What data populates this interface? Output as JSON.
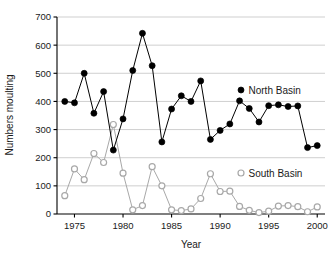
{
  "chart_data": {
    "type": "line",
    "title": "",
    "xlabel": "Year",
    "ylabel": "Numbers moulting",
    "xlim": [
      1973.2,
      2000.8
    ],
    "ylim": [
      0,
      700
    ],
    "xticks": [
      1975,
      1980,
      1985,
      1990,
      1995,
      2000
    ],
    "yticks": [
      0,
      100,
      200,
      300,
      400,
      500,
      600,
      700
    ],
    "grid": "horizontal",
    "legend_position": "inside-right",
    "x": [
      1974,
      1975,
      1976,
      1977,
      1978,
      1979,
      1980,
      1981,
      1982,
      1983,
      1984,
      1985,
      1986,
      1987,
      1988,
      1989,
      1990,
      1991,
      1992,
      1993,
      1994,
      1995,
      1996,
      1997,
      1998,
      1999,
      2000
    ],
    "series": [
      {
        "name": "North Basin",
        "marker": "filled-circle",
        "color": "#000000",
        "values": [
          400,
          395,
          500,
          358,
          435,
          227,
          338,
          510,
          642,
          527,
          256,
          373,
          420,
          400,
          473,
          265,
          297,
          320,
          402,
          375,
          327,
          385,
          388,
          382,
          384,
          236,
          243
        ]
      },
      {
        "name": "South Basin",
        "marker": "open-circle",
        "color": "#a8a8a8",
        "values": [
          65,
          160,
          122,
          215,
          183,
          318,
          145,
          15,
          30,
          168,
          100,
          15,
          12,
          18,
          55,
          143,
          80,
          81,
          27,
          13,
          5,
          10,
          28,
          30,
          26,
          8,
          25
        ]
      }
    ]
  },
  "legend": {
    "north": {
      "label": "North Basin",
      "marker": "filled-circle"
    },
    "south": {
      "label": "South Basin",
      "marker": "open-circle"
    }
  },
  "axes": {
    "x_title": "Year",
    "y_title": "Numbers moulting"
  }
}
